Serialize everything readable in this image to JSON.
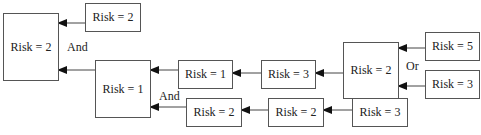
{
  "diagram": {
    "nodes": [
      {
        "id": "root",
        "label": "Risk = 2"
      },
      {
        "id": "root_child_top",
        "label": "Risk = 2"
      },
      {
        "id": "mid",
        "label": "Risk = 1"
      },
      {
        "id": "chain_a1",
        "label": "Risk = 1"
      },
      {
        "id": "chain_a2",
        "label": "Risk = 3"
      },
      {
        "id": "or_node",
        "label": "Risk = 2"
      },
      {
        "id": "or_in1",
        "label": "Risk = 5"
      },
      {
        "id": "or_in2",
        "label": "Risk = 3"
      },
      {
        "id": "chain_b1",
        "label": "Risk = 2"
      },
      {
        "id": "chain_b2",
        "label": "Risk = 2"
      },
      {
        "id": "chain_b3",
        "label": "Risk = 3"
      }
    ],
    "operators": [
      {
        "id": "and_root",
        "label": "And"
      },
      {
        "id": "and_mid",
        "label": "And"
      },
      {
        "id": "or_op",
        "label": "Or"
      }
    ],
    "edges": [
      {
        "from": "root_child_top",
        "to": "root"
      },
      {
        "from": "mid",
        "to": "root"
      },
      {
        "from": "chain_a1",
        "to": "mid"
      },
      {
        "from": "chain_b1",
        "to": "mid"
      },
      {
        "from": "chain_a2",
        "to": "chain_a1"
      },
      {
        "from": "or_node",
        "to": "chain_a2"
      },
      {
        "from": "or_in1",
        "to": "or_node"
      },
      {
        "from": "or_in2",
        "to": "or_node"
      },
      {
        "from": "chain_b2",
        "to": "chain_b1"
      },
      {
        "from": "chain_b3",
        "to": "chain_b2"
      }
    ]
  }
}
